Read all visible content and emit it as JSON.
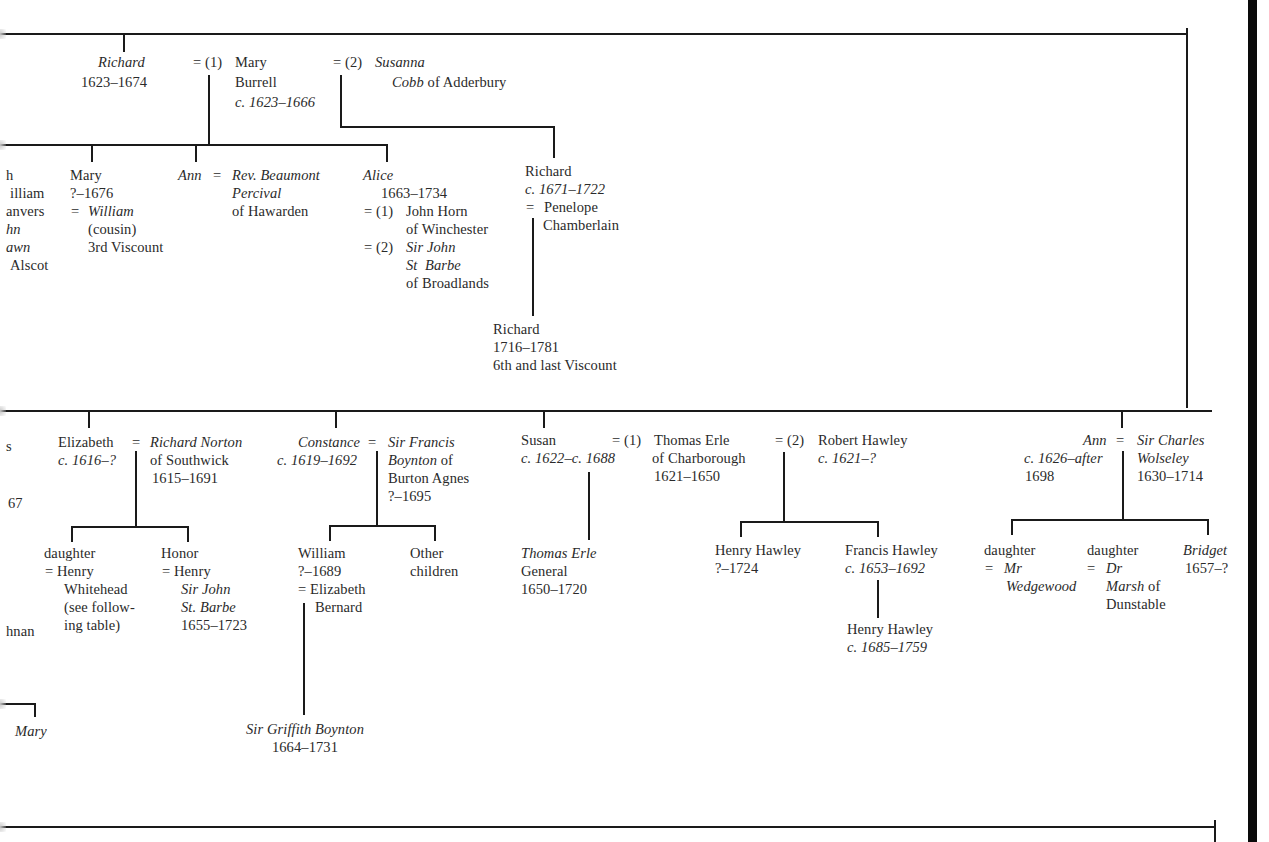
{
  "diagram": {
    "type": "family-tree",
    "top_branch": {
      "richard": {
        "name": "Richard",
        "dates": "1623–1674"
      },
      "spouse1": {
        "marker": "= (1)",
        "name": "Mary",
        "name2": "Burrell",
        "dates": "c. 1623–1666"
      },
      "spouse2": {
        "marker": "= (2)",
        "name": "Susanna",
        "name2_italic": "Cobb",
        "name2_rest": " of Adderbury"
      }
    },
    "children_of_first_marriage": {
      "cut_off_left": [
        "h",
        "illiam",
        "anvers",
        "hn",
        "awn",
        "Alscot"
      ],
      "mary": {
        "name": "Mary",
        "dates": "?–1676",
        "spouse_marker": "=",
        "spouse": "William",
        "note1": "(cousin)",
        "note2": "3rd Viscount"
      },
      "ann": {
        "name": "Ann",
        "marker": "=",
        "spouse_line1": "Rev. Beaumont",
        "spouse_line2": "Percival",
        "spouse_line3": "of Hawarden"
      },
      "alice": {
        "name": "Alice",
        "dates": "1663–1734",
        "marriage1": {
          "marker": "= (1)",
          "line1": "John Horn",
          "line2": "of Winchester"
        },
        "marriage2": {
          "marker": "= (2)",
          "line1": "Sir John",
          "line2": "St  Barbe",
          "line3": "of Broadlands"
        }
      }
    },
    "children_of_second_marriage": {
      "richard": {
        "name": "Richard",
        "dates": "c. 1671–1722",
        "spouse_marker": "=",
        "spouse_line1": "Penelope",
        "spouse_line2": "Chamberlain"
      },
      "grandson": {
        "name": "Richard",
        "dates": "1716–1781",
        "note": "6th and last Viscount"
      }
    },
    "second_generation_row": {
      "cut_off_left": [
        "s",
        "67",
        "hnan"
      ],
      "elizabeth": {
        "name": "Elizabeth",
        "dates": "c. 1616–?",
        "marker": "=",
        "spouse_line1": "Richard Norton",
        "spouse_line2": "of Southwick",
        "spouse_dates": "1615–1691",
        "children": [
          {
            "line1": "daughter",
            "line2": "= Henry",
            "line3": "Whitehead",
            "line4": "(see follow-",
            "line5": "ing table)"
          },
          {
            "line1": "Honor",
            "line2": "= Henry",
            "line3": "Sir John",
            "line4": "St. Barbe",
            "line5": "1655–1723"
          }
        ]
      },
      "constance": {
        "name": "Constance",
        "dates": "c. 1619–1692",
        "marker": "=",
        "spouse_line1": "Sir Francis",
        "spouse_line2_italic": "Boynton",
        "spouse_line2_rest": " of",
        "spouse_line3": "Burton Agnes",
        "spouse_dates": "?–1695",
        "children": [
          {
            "line1": "William",
            "line2": "?–1689",
            "line3": "= Elizabeth",
            "line4": "Bernard"
          },
          {
            "line1": "Other",
            "line2": "children"
          }
        ],
        "grandchild": {
          "name": "Sir Griffith Boynton",
          "dates": "1664–1731"
        }
      },
      "susan": {
        "name": "Susan",
        "dates": "c. 1622–c. 1688",
        "marriage1": {
          "marker": "= (1)",
          "line1": "Thomas Erle",
          "line2": "of Charborough",
          "dates": "1621–1650"
        },
        "marriage2": {
          "marker": "= (2)",
          "line1": "Robert Hawley",
          "dates": "c. 1621–?"
        },
        "child_m1": {
          "name": "Thomas Erle",
          "title": "General",
          "dates": "1650–1720"
        },
        "children_m2": [
          {
            "name": "Henry Hawley",
            "dates": "?–1724"
          },
          {
            "name": "Francis Hawley",
            "dates": "c. 1653–1692"
          }
        ],
        "grandchild_m2": {
          "name": "Henry Hawley",
          "dates": "c. 1685–1759"
        }
      },
      "ann": {
        "name": "Ann",
        "dates_line1": "c. 1626–after",
        "dates_line2": "1698",
        "marker": "=",
        "spouse_line1": "Sir Charles",
        "spouse_line2": "Wolseley",
        "spouse_dates": "1630–1714",
        "children": [
          {
            "line1": "daughter",
            "line2_marker": "=",
            "line2": "Mr",
            "line3": "Wedgewood"
          },
          {
            "line1": "daughter",
            "line2_marker": "=",
            "line2": "Dr",
            "line3_italic": "Marsh",
            "line3_rest": " of",
            "line4": "Dunstable"
          },
          {
            "line1": "Bridget",
            "line2": "1657–?"
          }
        ]
      }
    },
    "bottom_left": {
      "name": "Mary"
    }
  }
}
